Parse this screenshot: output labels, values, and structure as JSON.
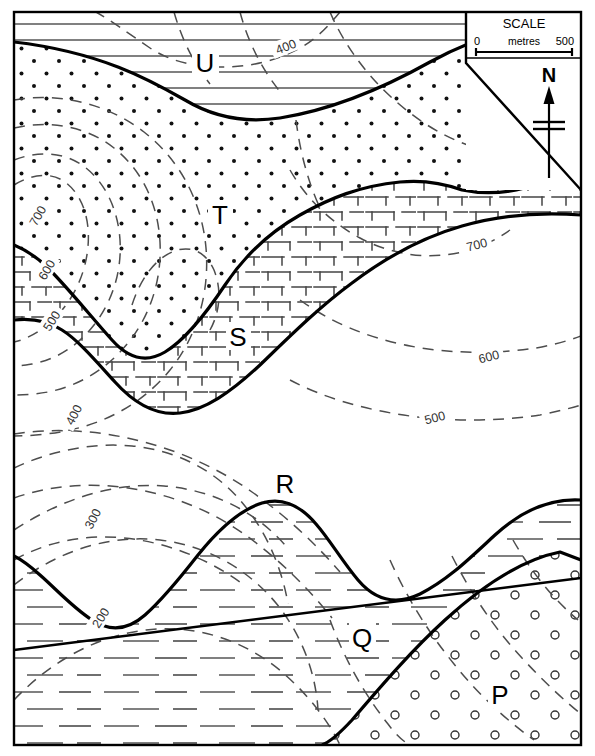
{
  "map": {
    "frame": {
      "x": 14,
      "y": 12,
      "width": 567,
      "height": 733
    },
    "border_color": "#000000",
    "background_color": "#ffffff"
  },
  "scale_bar": {
    "title": "SCALE",
    "units_label": "metres",
    "min_label": "0",
    "max_label": "500"
  },
  "north_arrow": {
    "label": "N"
  },
  "unit_labels": [
    {
      "id": "U",
      "text": "U",
      "x": 205,
      "y": 67,
      "pattern": "horizontal-lines"
    },
    {
      "id": "T",
      "text": "T",
      "x": 220,
      "y": 220,
      "pattern": "dots"
    },
    {
      "id": "S",
      "text": "S",
      "x": 238,
      "y": 342,
      "pattern": "brick"
    },
    {
      "id": "R",
      "text": "R",
      "x": 285,
      "y": 489,
      "pattern": "blank"
    },
    {
      "id": "Q",
      "text": "Q",
      "x": 362,
      "y": 643,
      "pattern": "dashes"
    },
    {
      "id": "P",
      "text": "P",
      "x": 500,
      "y": 700,
      "pattern": "circles"
    }
  ],
  "contour_labels": [
    {
      "value": "400",
      "x": 286,
      "y": 47,
      "rotate": -22
    },
    {
      "value": "700",
      "x": 38,
      "y": 216,
      "rotate": -60
    },
    {
      "value": "600",
      "x": 47,
      "y": 270,
      "rotate": -60
    },
    {
      "value": "500",
      "x": 52,
      "y": 321,
      "rotate": -58
    },
    {
      "value": "400",
      "x": 74,
      "y": 415,
      "rotate": -62
    },
    {
      "value": "300",
      "x": 93,
      "y": 519,
      "rotate": -62
    },
    {
      "value": "200",
      "x": 101,
      "y": 618,
      "rotate": -58
    },
    {
      "value": "700",
      "x": 477,
      "y": 245,
      "rotate": -14
    },
    {
      "value": "600",
      "x": 489,
      "y": 357,
      "rotate": -14
    },
    {
      "value": "500",
      "x": 435,
      "y": 418,
      "rotate": -14
    }
  ],
  "contour_interval": "100",
  "colors": {
    "line": "#000000",
    "contour": "#4d4d4d",
    "ornament": "#555555"
  }
}
